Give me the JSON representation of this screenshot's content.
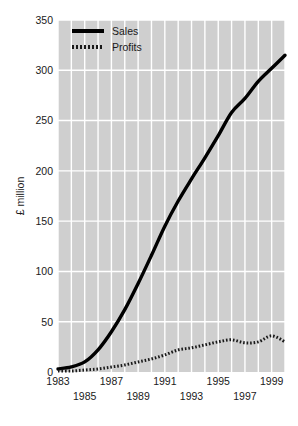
{
  "chart_data": {
    "type": "line",
    "title": "",
    "xlabel": "",
    "ylabel": "£ million",
    "xlim": [
      1983,
      2000
    ],
    "ylim": [
      0,
      350
    ],
    "grid": true,
    "grid_color": "#ffffff",
    "plot_background": "#cfcfcf",
    "legend_position": "top-left",
    "y_ticks": [
      0,
      50,
      100,
      150,
      200,
      250,
      300,
      350
    ],
    "y_tick_labels": [
      "0",
      "50",
      "100",
      "150",
      "200",
      "250",
      "300",
      "350"
    ],
    "x_ticks": [
      1983,
      1984,
      1985,
      1986,
      1987,
      1988,
      1989,
      1990,
      1991,
      1992,
      1993,
      1994,
      1995,
      1996,
      1997,
      1998,
      1999,
      2000
    ],
    "x_tick_labels_top": [
      "1983",
      "1987",
      "1991",
      "1995",
      "1999"
    ],
    "x_tick_labels_bottom": [
      "1985",
      "1989",
      "1993",
      "1997"
    ],
    "x_tick_label_top_years": [
      1983,
      1987,
      1991,
      1995,
      1999
    ],
    "x_tick_label_bottom_years": [
      1985,
      1989,
      1993,
      1997
    ],
    "x": [
      1983,
      1984,
      1985,
      1986,
      1987,
      1988,
      1989,
      1990,
      1991,
      1992,
      1993,
      1994,
      1995,
      1996,
      1997,
      1998,
      1999,
      2000
    ],
    "series": [
      {
        "name": "Sales",
        "style": "solid",
        "color": "#000000",
        "width": 3.4,
        "values": [
          3,
          5,
          10,
          22,
          40,
          62,
          88,
          116,
          145,
          170,
          192,
          213,
          235,
          258,
          272,
          289,
          302,
          315
        ]
      },
      {
        "name": "Profits",
        "style": "dotted",
        "color": "#1a1a1a",
        "width": 3.0,
        "values": [
          1,
          1,
          2,
          3,
          5,
          7,
          10,
          13,
          17,
          22,
          24,
          27,
          30,
          32,
          29,
          30,
          36,
          30
        ]
      }
    ]
  },
  "legend": {
    "items": [
      {
        "label": "Sales",
        "style": "solid"
      },
      {
        "label": "Profits",
        "style": "dotted"
      }
    ]
  },
  "axis": {
    "y_title": "£ million"
  }
}
